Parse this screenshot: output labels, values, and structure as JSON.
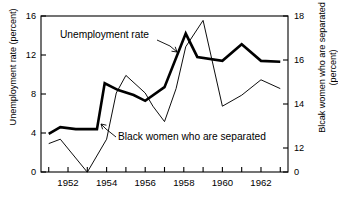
{
  "chart_data": {
    "type": "line",
    "title": "",
    "xlabel": "",
    "ylabel": "Unemployment rate (percent)",
    "ylabel_right_line1": "Blcak women who are separated",
    "ylabel_right_line2": "(percent)",
    "grid": false,
    "legend_position": "inline-annotations",
    "xlim": [
      1950.6,
      1963.4
    ],
    "ylim": [
      0,
      16
    ],
    "ylim_right": [
      0,
      18
    ],
    "x_ticks_major": [
      1952,
      1954,
      1956,
      1958,
      1960,
      1962
    ],
    "x_tick_labels": [
      "1952",
      "1954",
      "1956",
      "1958",
      "1960",
      "1962"
    ],
    "x_ticks_minor": [
      1951,
      1953,
      1955,
      1957,
      1959,
      1961,
      1963
    ],
    "y_ticks_left": [
      0,
      4,
      8,
      12,
      16
    ],
    "y_tick_labels_left": [
      "0",
      "4",
      "8",
      "12",
      "16"
    ],
    "y_ticks_right": [
      0,
      12,
      14,
      16,
      18
    ],
    "y_tick_labels_right": [
      "0",
      "12",
      "14",
      "16",
      "18"
    ],
    "right_axis_break": true,
    "x": [
      1951,
      1952,
      1953,
      1954,
      1955,
      1956,
      1957,
      1958,
      1959,
      1960,
      1961,
      1962,
      1963
    ],
    "series": [
      {
        "name": "Unemployment rate",
        "axis": "left",
        "style": "thick",
        "values": [
          3.9,
          4.6,
          4.4,
          4.4,
          9.1,
          8.4,
          7.9,
          7.3,
          8.7,
          14.2,
          11.8,
          11.4,
          13.1,
          11.4,
          11.3
        ],
        "x_values": [
          1951,
          1951.6,
          1952.4,
          1953.5,
          1953.9,
          1954.6,
          1955.4,
          1956,
          1957,
          1958.1,
          1958.7,
          1960,
          1961,
          1962,
          1963
        ]
      },
      {
        "name": "Black women who are separated",
        "axis": "right",
        "style": "thin",
        "values": [
          12.2,
          12.4,
          10.9,
          12.4,
          14.5,
          15.3,
          14.5,
          13.9,
          13.2,
          14.7,
          16.6,
          17.8,
          13.9,
          14.4,
          15.1,
          14.7
        ],
        "x_values": [
          1951,
          1951.6,
          1953,
          1954,
          1954.5,
          1955,
          1956,
          1956.4,
          1957,
          1957.6,
          1958.1,
          1959,
          1960,
          1961,
          1962,
          1963
        ]
      }
    ],
    "annotations": [
      {
        "name": "unemployment-rate-label",
        "text": "Unemployment rate",
        "x_px": 60,
        "y_px": 38
      },
      {
        "name": "black-women-separated-label",
        "text": "Black women who are separated",
        "x_px": 118,
        "y_px": 140
      }
    ],
    "colors": {
      "line": "#000000",
      "axis": "#000000",
      "background": "#ffffff"
    }
  }
}
